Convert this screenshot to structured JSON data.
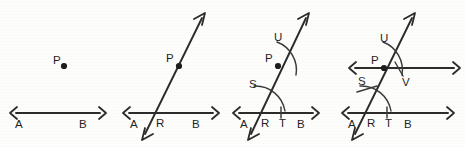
{
  "figure": {
    "background_color": "#fdfdfc",
    "ink_color": "#2b2b2b",
    "panel_count": 4,
    "panels": [
      {
        "id": "panel-1",
        "step": "1",
        "caption": "Given line AB and point P not on AB",
        "labels": {
          "point_p": "P",
          "line_left": "A",
          "line_right": "B"
        },
        "elements": [
          "line-ab",
          "point-p"
        ]
      },
      {
        "id": "panel-2",
        "step": "2",
        "caption": "Draw a transversal through P meeting AB at R",
        "labels": {
          "point_p": "P",
          "line_left": "A",
          "intersection": "R",
          "line_right": "B"
        },
        "elements": [
          "line-ab",
          "transversal",
          "point-p"
        ]
      },
      {
        "id": "panel-3",
        "step": "3",
        "caption": "With centre R draw an arc cutting the transversal at S and AB at T; with centre P draw an equal arc cutting the transversal at U",
        "labels": {
          "point_u": "U",
          "point_p": "P",
          "point_s": "S",
          "line_left": "A",
          "intersection": "R",
          "point_t": "T",
          "line_right": "B"
        },
        "elements": [
          "line-ab",
          "transversal",
          "point-p",
          "arc-r",
          "arc-p",
          "tick-t"
        ]
      },
      {
        "id": "panel-4",
        "step": "4",
        "caption": "Mark V so that UV equals ST, then draw the line through P and V parallel to AB",
        "labels": {
          "point_u": "U",
          "point_p": "P",
          "point_v": "V",
          "point_s": "S",
          "line_left": "A",
          "intersection": "R",
          "point_t": "T",
          "line_right": "B"
        },
        "elements": [
          "line-ab",
          "transversal",
          "point-p",
          "arc-r",
          "arc-p",
          "tick-t",
          "tick-s",
          "tick-v",
          "parallel-line"
        ]
      }
    ]
  }
}
